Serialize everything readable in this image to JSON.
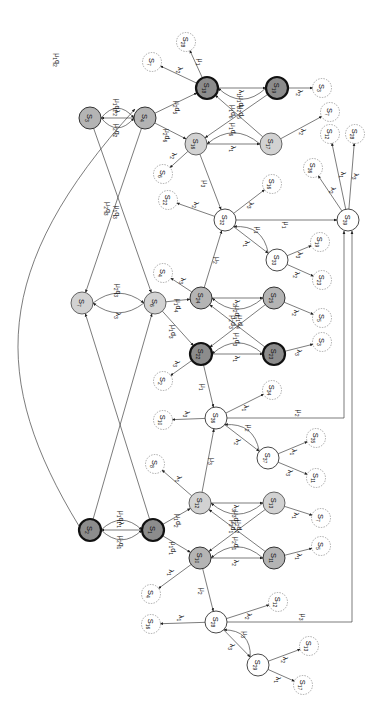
{
  "diagram": {
    "type": "state-transition-diagram",
    "orientation": "rotated-90",
    "node_styles": {
      "dark": {
        "fill": "#8c8c8c",
        "stroke": "#111111",
        "stroke_width": 2.2
      },
      "mid": {
        "fill": "#b4b4b4",
        "stroke": "#333333",
        "stroke_width": 1
      },
      "light": {
        "fill": "#d2d2d2",
        "stroke": "#444444",
        "stroke_width": 0.8
      },
      "white": {
        "fill": "#ffffff",
        "stroke": "#333333",
        "stroke_width": 0.9
      },
      "dashed": {
        "fill": "#ffffff",
        "stroke": "#888888",
        "stroke_width": 0.7
      }
    },
    "nodes": [
      {
        "id": "S3",
        "label": "S3",
        "x": 90,
        "y": 118,
        "style": "mid"
      },
      {
        "id": "S4a",
        "label": "S4",
        "x": 145,
        "y": 118,
        "style": "mid"
      },
      {
        "id": "S18",
        "label": "S18",
        "x": 207,
        "y": 88,
        "style": "dark"
      },
      {
        "id": "S19",
        "label": "S19",
        "x": 277,
        "y": 88,
        "style": "dark"
      },
      {
        "id": "S16",
        "label": "S16",
        "x": 196,
        "y": 144,
        "style": "light"
      },
      {
        "id": "S17",
        "label": "S17",
        "x": 271,
        "y": 144,
        "style": "light"
      },
      {
        "id": "S7",
        "label": "S7",
        "x": 82,
        "y": 303,
        "style": "light"
      },
      {
        "id": "S6",
        "label": "S6",
        "x": 155,
        "y": 303,
        "style": "light"
      },
      {
        "id": "S24",
        "label": "S24",
        "x": 201,
        "y": 298,
        "style": "mid"
      },
      {
        "id": "S25",
        "label": "S25",
        "x": 274,
        "y": 298,
        "style": "mid"
      },
      {
        "id": "S22",
        "label": "S22",
        "x": 201,
        "y": 354,
        "style": "dark"
      },
      {
        "id": "S23",
        "label": "S23",
        "x": 274,
        "y": 354,
        "style": "dark"
      },
      {
        "id": "S32",
        "label": "S32",
        "x": 225,
        "y": 220,
        "style": "white"
      },
      {
        "id": "S33",
        "label": "S33",
        "x": 277,
        "y": 260,
        "style": "white"
      },
      {
        "id": "S39",
        "label": "S39",
        "x": 348,
        "y": 220,
        "style": "white"
      },
      {
        "id": "S36",
        "label": "S36",
        "x": 216,
        "y": 418,
        "style": "white"
      },
      {
        "id": "S37",
        "label": "S37",
        "x": 268,
        "y": 458,
        "style": "white"
      },
      {
        "id": "S2",
        "label": "S2",
        "x": 90,
        "y": 530,
        "style": "dark"
      },
      {
        "id": "S1",
        "label": "S1",
        "x": 153,
        "y": 530,
        "style": "dark"
      },
      {
        "id": "S12",
        "label": "S12",
        "x": 200,
        "y": 503,
        "style": "light"
      },
      {
        "id": "S13",
        "label": "S13",
        "x": 274,
        "y": 503,
        "style": "light"
      },
      {
        "id": "S10",
        "label": "S10",
        "x": 200,
        "y": 558,
        "style": "mid"
      },
      {
        "id": "S11",
        "label": "S11",
        "x": 274,
        "y": 558,
        "style": "mid"
      },
      {
        "id": "S28",
        "label": "S28",
        "x": 216,
        "y": 622,
        "style": "white"
      },
      {
        "id": "S29",
        "label": "S29",
        "x": 258,
        "y": 665,
        "style": "white"
      },
      {
        "id": "d_S28a",
        "label": "S28",
        "x": 186,
        "y": 42,
        "style": "dashed"
      },
      {
        "id": "d_S7a",
        "label": "S7",
        "x": 152,
        "y": 62,
        "style": "dashed"
      },
      {
        "id": "d_S3a",
        "label": "S3",
        "x": 322,
        "y": 88,
        "style": "dashed"
      },
      {
        "id": "d_S7b",
        "label": "S7",
        "x": 330,
        "y": 112,
        "style": "dashed"
      },
      {
        "id": "d_S12a",
        "label": "S12",
        "x": 330,
        "y": 134,
        "style": "dashed"
      },
      {
        "id": "d_S28b",
        "label": "S28",
        "x": 355,
        "y": 134,
        "style": "dashed"
      },
      {
        "id": "d_S36",
        "label": "S36",
        "x": 313,
        "y": 168,
        "style": "dashed"
      },
      {
        "id": "d_S6a",
        "label": "S6",
        "x": 163,
        "y": 174,
        "style": "dashed"
      },
      {
        "id": "d_S16",
        "label": "S16",
        "x": 272,
        "y": 184,
        "style": "dashed"
      },
      {
        "id": "d_S22",
        "label": "S22",
        "x": 168,
        "y": 200,
        "style": "dashed"
      },
      {
        "id": "d_S19",
        "label": "S19",
        "x": 320,
        "y": 242,
        "style": "dashed"
      },
      {
        "id": "d_S23",
        "label": "S23",
        "x": 322,
        "y": 280,
        "style": "dashed"
      },
      {
        "id": "d_S4b",
        "label": "S4",
        "x": 163,
        "y": 273,
        "style": "dashed"
      },
      {
        "id": "d_S5a",
        "label": "S5",
        "x": 322,
        "y": 318,
        "style": "dashed"
      },
      {
        "id": "d_S3b",
        "label": "S3",
        "x": 322,
        "y": 342,
        "style": "dashed"
      },
      {
        "id": "d_S2",
        "label": "S2",
        "x": 163,
        "y": 381,
        "style": "dashed"
      },
      {
        "id": "d_S34",
        "label": "S34",
        "x": 272,
        "y": 390,
        "style": "dashed"
      },
      {
        "id": "d_S10",
        "label": "S10",
        "x": 163,
        "y": 420,
        "style": "dashed"
      },
      {
        "id": "d_S35",
        "label": "S35",
        "x": 316,
        "y": 438,
        "style": "dashed"
      },
      {
        "id": "d_S11",
        "label": "S11",
        "x": 316,
        "y": 478,
        "style": "dashed"
      },
      {
        "id": "d_S8",
        "label": "S8",
        "x": 155,
        "y": 464,
        "style": "dashed"
      },
      {
        "id": "d_S7c",
        "label": "S7",
        "x": 321,
        "y": 518,
        "style": "dashed"
      },
      {
        "id": "d_S5b",
        "label": "S5",
        "x": 321,
        "y": 546,
        "style": "dashed"
      },
      {
        "id": "d_S12b",
        "label": "S12",
        "x": 278,
        "y": 602,
        "style": "dashed"
      },
      {
        "id": "d_S4c",
        "label": "S4",
        "x": 151,
        "y": 594,
        "style": "dashed"
      },
      {
        "id": "d_S16b",
        "label": "S16",
        "x": 151,
        "y": 624,
        "style": "dashed"
      },
      {
        "id": "d_S13",
        "label": "S13",
        "x": 309,
        "y": 646,
        "style": "dashed"
      },
      {
        "id": "d_S17",
        "label": "S17",
        "x": 303,
        "y": 685,
        "style": "dashed"
      }
    ],
    "edges": [
      {
        "from": "S4a",
        "to": "S3",
        "label": "λ2"
      },
      {
        "from": "S3",
        "to": "S4a",
        "label": "μ1q2",
        "curve": -14
      },
      {
        "from": "S3",
        "to": "S4a",
        "label": "μ2q2",
        "curve": 14
      },
      {
        "from": "S4a",
        "to": "S18",
        "label": "μ2d5"
      },
      {
        "from": "S4a",
        "to": "S16",
        "label": "μ2d6"
      },
      {
        "from": "S18",
        "to": "S19",
        "label": "λ1"
      },
      {
        "from": "S19",
        "to": "S18",
        "label": "μ1d5",
        "curve": -16
      },
      {
        "from": "S19",
        "to": "S16",
        "label": "μ1d6"
      },
      {
        "from": "S17",
        "to": "S18",
        "label": "μ2d5"
      },
      {
        "from": "S16",
        "to": "S17",
        "label": "λ1"
      },
      {
        "from": "S17",
        "to": "S16",
        "label": "μ1d6",
        "curve": 16
      },
      {
        "from": "S18",
        "to": "d_S28a",
        "label": "μ1"
      },
      {
        "from": "S18",
        "to": "d_S7a",
        "label": "λ2"
      },
      {
        "from": "S19",
        "to": "d_S3a",
        "label": "λ2"
      },
      {
        "from": "S17",
        "to": "d_S7b",
        "label": "λ2"
      },
      {
        "from": "S16",
        "to": "d_S6a",
        "label": "λ2"
      },
      {
        "from": "S16",
        "to": "S32",
        "label": "μ3"
      },
      {
        "from": "S32",
        "to": "d_S22",
        "label": "λ2"
      },
      {
        "from": "S32",
        "to": "d_S16",
        "label": "λ3"
      },
      {
        "from": "S32",
        "to": "S39",
        "label": "μ1"
      },
      {
        "from": "S32",
        "to": "S33",
        "label": "λ1"
      },
      {
        "from": "S33",
        "to": "S32",
        "label": "μ1",
        "curve": 14
      },
      {
        "from": "S33",
        "to": "d_S19",
        "label": "λ3"
      },
      {
        "from": "S33",
        "to": "d_S23",
        "label": "λ2"
      },
      {
        "from": "S39",
        "to": "d_S36",
        "label": "λ2"
      },
      {
        "from": "S39",
        "to": "d_S12a",
        "label": "λ1"
      },
      {
        "from": "S39",
        "to": "d_S28b",
        "label": "λ3"
      },
      {
        "from": "S3",
        "to": "S6",
        "label": "μ1q3"
      },
      {
        "from": "S4a",
        "to": "S7",
        "label": "μ2q3"
      },
      {
        "from": "S6",
        "to": "S7",
        "label": "λ3",
        "curve": -14
      },
      {
        "from": "S7",
        "to": "S6",
        "label": "μ2q3",
        "curve": -14
      },
      {
        "from": "S6",
        "to": "S24",
        "label": "μ1d4"
      },
      {
        "from": "S6",
        "to": "S22",
        "label": "μ1d3"
      },
      {
        "from": "S24",
        "to": "d_S4b",
        "label": "λ3"
      },
      {
        "from": "S24",
        "to": "S32",
        "label": "μ2"
      },
      {
        "from": "S24",
        "to": "S25",
        "label": "λ2"
      },
      {
        "from": "S25",
        "to": "S24",
        "label": "μ2d4",
        "curve": -16
      },
      {
        "from": "S25",
        "to": "S22",
        "label": "μ2d3"
      },
      {
        "from": "S23",
        "to": "S24",
        "label": "μ1d4"
      },
      {
        "from": "S22",
        "to": "S23",
        "label": "λ1"
      },
      {
        "from": "S23",
        "to": "S22",
        "label": "μ1d3",
        "curve": 16
      },
      {
        "from": "S25",
        "to": "d_S5a",
        "label": "λ2"
      },
      {
        "from": "S23",
        "to": "d_S3b",
        "label": "λ3"
      },
      {
        "from": "S22",
        "to": "d_S2",
        "label": "λ3"
      },
      {
        "from": "S22",
        "to": "S36",
        "label": "μ1"
      },
      {
        "from": "S36",
        "to": "d_S10",
        "label": "λ3"
      },
      {
        "from": "S36",
        "to": "d_S34",
        "label": "λ1"
      },
      {
        "from": "S36",
        "to": "S37",
        "label": "λ2"
      },
      {
        "from": "S37",
        "to": "S36",
        "label": "μ2",
        "curve": 14
      },
      {
        "from": "S37",
        "to": "d_S35",
        "label": "λ1"
      },
      {
        "from": "S37",
        "to": "d_S11",
        "label": "λ3"
      },
      {
        "from": "S36",
        "to": "S39",
        "label": "μ2",
        "route": "elbow"
      },
      {
        "from": "S1",
        "to": "S2",
        "label": "λ1"
      },
      {
        "from": "S2",
        "to": "S1",
        "label": "μ1q1",
        "curve": -14
      },
      {
        "from": "S2",
        "to": "S1",
        "label": "μ2q1",
        "curve": 14
      },
      {
        "from": "S2",
        "to": "S4a",
        "label": "μ1q2",
        "route": "long-arc"
      },
      {
        "from": "S2",
        "to": "S6",
        "label": ""
      },
      {
        "from": "S1",
        "to": "S7",
        "label": ""
      },
      {
        "from": "S1",
        "to": "S12",
        "label": "μ1d2"
      },
      {
        "from": "S1",
        "to": "S10",
        "label": "μ1d1"
      },
      {
        "from": "S12",
        "to": "d_S8",
        "label": "λ1"
      },
      {
        "from": "S12",
        "to": "S36",
        "label": "μ3"
      },
      {
        "from": "S12",
        "to": "S13",
        "label": "λ3"
      },
      {
        "from": "S13",
        "to": "S12",
        "label": "μ3d2",
        "curve": -16
      },
      {
        "from": "S13",
        "to": "S10",
        "label": "μ3d1"
      },
      {
        "from": "S11",
        "to": "S12",
        "label": "μ2d2"
      },
      {
        "from": "S10",
        "to": "S11",
        "label": "λ2"
      },
      {
        "from": "S11",
        "to": "S10",
        "label": "μ2d1",
        "curve": 16
      },
      {
        "from": "S13",
        "to": "d_S7c",
        "label": "λ1"
      },
      {
        "from": "S11",
        "to": "d_S5b",
        "label": "λ1"
      },
      {
        "from": "S10",
        "to": "d_S4c",
        "label": "λ1"
      },
      {
        "from": "S10",
        "to": "S28",
        "label": "μ2"
      },
      {
        "from": "S28",
        "to": "d_S16b",
        "label": "λ1"
      },
      {
        "from": "S28",
        "to": "d_S12b",
        "label": "λ2"
      },
      {
        "from": "S28",
        "to": "S29",
        "label": "λ3"
      },
      {
        "from": "S29",
        "to": "S28",
        "label": "μ3",
        "curve": 14
      },
      {
        "from": "S29",
        "to": "d_S13",
        "label": "λ2"
      },
      {
        "from": "S29",
        "to": "d_S17",
        "label": "λ1"
      },
      {
        "from": "S28",
        "to": "S39",
        "label": "μ3",
        "route": "elbow"
      }
    ]
  }
}
